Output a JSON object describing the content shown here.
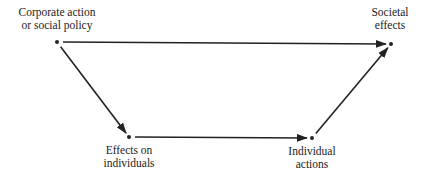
{
  "diagram": {
    "type": "flow",
    "stroke_color": "#222222",
    "nodes": [
      {
        "id": "corporate",
        "lines": [
          "Corporate action",
          "or social policy"
        ],
        "x": 57,
        "y": 42
      },
      {
        "id": "societal",
        "lines": [
          "Societal",
          "effects"
        ],
        "x": 391,
        "y": 44
      },
      {
        "id": "effects_individuals",
        "lines": [
          "Effects on",
          "individuals"
        ],
        "x": 129,
        "y": 137
      },
      {
        "id": "individual_actions",
        "lines": [
          "Individual",
          "actions"
        ],
        "x": 312,
        "y": 138
      }
    ],
    "edges": [
      {
        "from": "corporate",
        "to": "societal"
      },
      {
        "from": "corporate",
        "to": "effects_individuals"
      },
      {
        "from": "effects_individuals",
        "to": "individual_actions"
      },
      {
        "from": "individual_actions",
        "to": "societal"
      }
    ]
  }
}
